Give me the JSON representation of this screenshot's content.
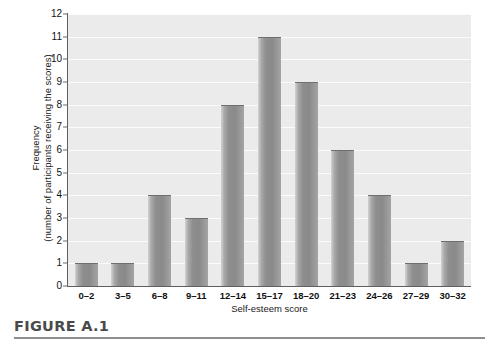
{
  "figure": {
    "caption": "FIGURE A.1"
  },
  "chart_data": {
    "type": "bar",
    "title": "",
    "xlabel": "Self-esteem score",
    "ylabel_line1": "Frequency",
    "ylabel_line2": "(number of participants receiving the scores)",
    "categories": [
      "0–2",
      "3–5",
      "6–8",
      "9–11",
      "12–14",
      "15–17",
      "18–20",
      "21–23",
      "24–26",
      "27–29",
      "30–32"
    ],
    "values": [
      1,
      1,
      4,
      3,
      8,
      11,
      9,
      6,
      4,
      1,
      2
    ],
    "ylim": [
      0,
      12
    ],
    "yticks": [
      0,
      1,
      2,
      3,
      4,
      5,
      6,
      7,
      8,
      9,
      10,
      11,
      12
    ],
    "ytick_labels": [
      "0",
      "1",
      "2",
      "3",
      "4",
      "5",
      "6",
      "7",
      "8",
      "9",
      "10",
      "11",
      "12"
    ],
    "grid": true,
    "legend": null,
    "colors": {
      "plot_background": "#ebebeb",
      "gridline": "#fbfbfb",
      "bar_fill": "#8e8e8e",
      "bar_edge": "#6f6f6f",
      "axis": "#5f5f5f",
      "text": "#1a1a1a",
      "caption": "#4a4a4a"
    }
  }
}
